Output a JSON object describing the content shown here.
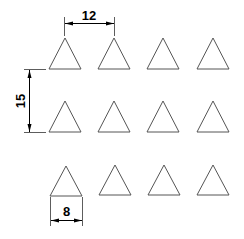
{
  "diagram": {
    "type": "triangle-grid-dimension-drawing",
    "rows": 3,
    "columns": 4,
    "colors": {
      "shape_stroke": "#555555",
      "dimension": "#000000",
      "background": "#ffffff"
    },
    "triangles": [
      {
        "row": 1,
        "col": 1,
        "apex": [
          65,
          38
        ],
        "left": [
          49,
          69
        ],
        "right": [
          81,
          69
        ]
      },
      {
        "row": 1,
        "col": 2,
        "apex": [
          114,
          38
        ],
        "left": [
          98,
          69
        ],
        "right": [
          130,
          69
        ]
      },
      {
        "row": 1,
        "col": 3,
        "apex": [
          163,
          38
        ],
        "left": [
          147,
          69
        ],
        "right": [
          179,
          69
        ]
      },
      {
        "row": 1,
        "col": 4,
        "apex": [
          213,
          38
        ],
        "left": [
          197,
          69
        ],
        "right": [
          229,
          69
        ]
      },
      {
        "row": 2,
        "col": 1,
        "apex": [
          65,
          101
        ],
        "left": [
          49,
          132
        ],
        "right": [
          81,
          132
        ]
      },
      {
        "row": 2,
        "col": 2,
        "apex": [
          114,
          101
        ],
        "left": [
          98,
          132
        ],
        "right": [
          130,
          132
        ]
      },
      {
        "row": 2,
        "col": 3,
        "apex": [
          163,
          101
        ],
        "left": [
          147,
          132
        ],
        "right": [
          179,
          132
        ]
      },
      {
        "row": 2,
        "col": 4,
        "apex": [
          213,
          101
        ],
        "left": [
          197,
          132
        ],
        "right": [
          229,
          132
        ]
      },
      {
        "row": 3,
        "col": 1,
        "apex": [
          66,
          166
        ],
        "left": [
          50,
          196
        ],
        "right": [
          82,
          196
        ]
      },
      {
        "row": 3,
        "col": 2,
        "apex": [
          115,
          165
        ],
        "left": [
          99,
          195
        ],
        "right": [
          131,
          195
        ]
      },
      {
        "row": 3,
        "col": 3,
        "apex": [
          164,
          165
        ],
        "left": [
          148,
          195
        ],
        "right": [
          180,
          195
        ]
      },
      {
        "row": 3,
        "col": 4,
        "apex": [
          213,
          165
        ],
        "left": [
          197,
          195
        ],
        "right": [
          229,
          195
        ]
      }
    ],
    "dimensions": {
      "horizontal_spacing": {
        "label": "12",
        "meaning": "apex-to-apex horizontal pitch"
      },
      "vertical_spacing": {
        "label": "15",
        "meaning": "base-to-base vertical pitch"
      },
      "base_width": {
        "label": "8",
        "meaning": "triangle base width"
      }
    }
  }
}
